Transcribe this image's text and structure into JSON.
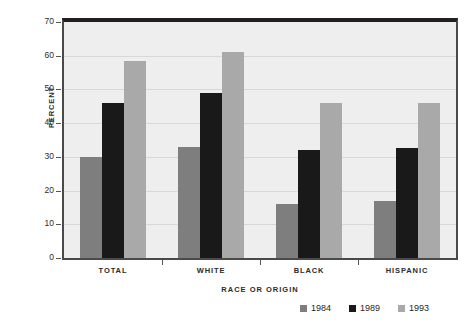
{
  "chart_data": {
    "type": "bar",
    "title": "",
    "xlabel": "RACE OR ORIGIN",
    "ylabel": "PERCENT",
    "categories": [
      "TOTAL",
      "WHITE",
      "BLACK",
      "HISPANIC"
    ],
    "series": [
      {
        "name": "1984",
        "color": "#7e7e7e",
        "values": [
          30,
          33,
          16,
          17
        ]
      },
      {
        "name": "1989",
        "color": "#191919",
        "values": [
          46,
          49,
          32,
          32.5
        ]
      },
      {
        "name": "1993",
        "color": "#a9a9a9",
        "values": [
          58.5,
          61,
          46,
          46
        ]
      }
    ],
    "ylim": [
      0,
      70
    ],
    "yticks": [
      0,
      10,
      20,
      30,
      40,
      50,
      60,
      70
    ],
    "ytick_labels": [
      "0",
      "10",
      "20",
      "30",
      "40",
      "50",
      "60",
      "70"
    ],
    "grid": true,
    "legend_position": "bottom-right",
    "plot_background": "#eeeeee",
    "frame_color": "#231f20"
  },
  "legend": {
    "items": [
      {
        "label": "1984"
      },
      {
        "label": "1989"
      },
      {
        "label": "1993"
      }
    ]
  }
}
